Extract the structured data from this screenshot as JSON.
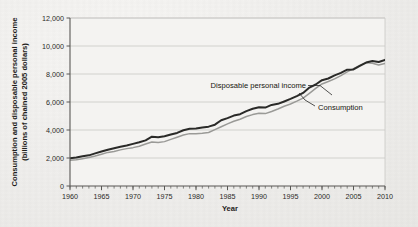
{
  "chart_data": {
    "type": "line",
    "title": "",
    "xlabel": "Year",
    "ylabel": "Consumption and disposable personal income (billions of chained 2005 dollars)",
    "ylabel_line1": "Consumption and disposable personal income",
    "ylabel_line2": "(billions of chained 2005 dollars)",
    "xlim": [
      1960,
      2010
    ],
    "ylim": [
      0,
      12000
    ],
    "grid": true,
    "legend_position": "inline-annotations",
    "xticks": [
      1960,
      1965,
      1970,
      1975,
      1980,
      1985,
      1990,
      1995,
      2000,
      2005,
      2010
    ],
    "xtick_labels": [
      "1960",
      "1965",
      "1970",
      "1975",
      "1980",
      "1985",
      "1990",
      "1995",
      "2000",
      "2005",
      "2010"
    ],
    "x_minor_tick_interval": 1,
    "yticks": [
      0,
      2000,
      4000,
      6000,
      8000,
      10000,
      12000
    ],
    "ytick_labels": [
      "0",
      "2,000",
      "4,000",
      "6,000",
      "8,000",
      "10,000",
      "12,000"
    ],
    "x": [
      1960,
      1961,
      1962,
      1963,
      1964,
      1965,
      1966,
      1967,
      1968,
      1969,
      1970,
      1971,
      1972,
      1973,
      1974,
      1975,
      1976,
      1977,
      1978,
      1979,
      1980,
      1981,
      1982,
      1983,
      1984,
      1985,
      1986,
      1987,
      1988,
      1989,
      1990,
      1991,
      1992,
      1993,
      1994,
      1995,
      1996,
      1997,
      1998,
      1999,
      2000,
      2001,
      2002,
      2003,
      2004,
      2005,
      2006,
      2007,
      2008,
      2009,
      2010
    ],
    "series": [
      {
        "name": "Disposable personal income",
        "color": "#2a2a28",
        "annotation": "Disposable personal income",
        "values": [
          1990,
          2030,
          2120,
          2190,
          2330,
          2460,
          2590,
          2690,
          2800,
          2890,
          3010,
          3120,
          3260,
          3520,
          3490,
          3560,
          3680,
          3790,
          3980,
          4090,
          4100,
          4180,
          4240,
          4380,
          4700,
          4850,
          5030,
          5130,
          5350,
          5520,
          5620,
          5600,
          5790,
          5870,
          6040,
          6220,
          6420,
          6650,
          7030,
          7250,
          7560,
          7680,
          7900,
          8080,
          8310,
          8330,
          8580,
          8820,
          8930,
          8860,
          9010
        ],
        "note": "Upper dark line; visible 1973 bump and 2008-09 flattening."
      },
      {
        "name": "Consumption",
        "color": "#9a9a97",
        "annotation": "Consumption",
        "values": [
          1840,
          1870,
          1950,
          2030,
          2140,
          2270,
          2400,
          2460,
          2580,
          2670,
          2740,
          2840,
          3000,
          3140,
          3100,
          3170,
          3330,
          3480,
          3640,
          3740,
          3730,
          3760,
          3820,
          4030,
          4230,
          4440,
          4620,
          4770,
          4960,
          5100,
          5200,
          5170,
          5320,
          5500,
          5700,
          5860,
          6060,
          6280,
          6620,
          6970,
          7290,
          7460,
          7650,
          7890,
          8150,
          8390,
          8620,
          8810,
          8770,
          8640,
          8750
        ],
        "note": "Lower gray line; crosses near-parallel below income, closes gap after 2000."
      }
    ],
    "annotations": [
      {
        "text": "Disposable personal income",
        "target_year": 1994,
        "leader": true
      },
      {
        "text": "Consumption",
        "target_year": 1996,
        "leader": true
      }
    ]
  },
  "axis": {
    "x_title": "Year",
    "y_title_line1": "Consumption and disposable personal income",
    "y_title_line2": "(billions of chained 2005 dollars)"
  },
  "colors": {
    "background": "#efeeec",
    "plot_background": "#f4f3f1",
    "grid": "#c9c8c5",
    "axis": "#585754",
    "income_line": "#2a2a28",
    "consumption_line": "#9a9a97",
    "text": "#1f1e1c"
  }
}
